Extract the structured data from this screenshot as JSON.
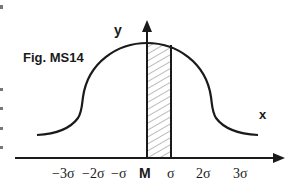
{
  "figure": {
    "caption": "Fig. MS14",
    "y_axis_label": "y",
    "x_axis_label": "x",
    "tick_labels": [
      "−3σ",
      "−2σ",
      "−σ",
      "M",
      "σ",
      "2σ",
      "3σ"
    ],
    "mean_label": "M",
    "shaded_region": {
      "from": "M",
      "to": "σ"
    },
    "curve": "normal distribution (bell curve)",
    "colors": {
      "stroke": "#1a1a1a",
      "background": "#ffffff",
      "hatch": "#555555"
    }
  }
}
